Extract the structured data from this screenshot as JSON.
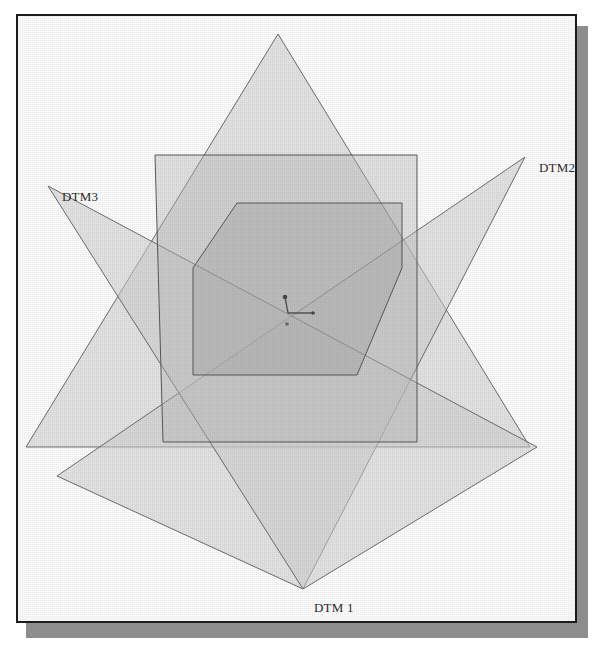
{
  "figure": {
    "background_color": "#ffffff",
    "frame_border_color": "#1c1c1c",
    "shadow_color": "#8d8d8d"
  },
  "labels": {
    "dtm1": "DTM 1",
    "dtm2": "DTM2",
    "dtm3": "DTM3"
  },
  "chart_data": {
    "type": "diagram",
    "subtype": "overlapping-polygon-extents",
    "xlabel": "",
    "ylabel": "",
    "grid": false,
    "legend_position": "inline-vertex-labels",
    "canvas": {
      "width": 557,
      "height": 605,
      "units": "px"
    },
    "fill_opacity_note": "semi-transparent grey fills; overlaps darken",
    "series": [
      {
        "name": "DTM 1",
        "shape": "triangle",
        "orientation": "apex-down",
        "fill": "#d2d2d2",
        "stroke": "#6e6e6e",
        "label_anchor": [
          303,
          589
        ],
        "vertices": [
          [
            278,
            34
          ],
          [
            530,
            447
          ],
          [
            26,
            447
          ]
        ],
        "note": "large triangle apex pointing down to bottom label"
      },
      {
        "name": "DTM2",
        "shape": "triangle",
        "orientation": "apex-down-left",
        "fill": "#d2d2d2",
        "stroke": "#6e6e6e",
        "label_anchor": [
          525,
          157
        ],
        "vertices": [
          [
            525,
            157
          ],
          [
            57,
            476
          ],
          [
            303,
            589
          ]
        ],
        "note": "top-right labelled vertex"
      },
      {
        "name": "DTM3",
        "shape": "triangle",
        "orientation": "apex-down-right",
        "fill": "#d2d2d2",
        "stroke": "#6e6e6e",
        "label_anchor": [
          48,
          186
        ],
        "vertices": [
          [
            48,
            186
          ],
          [
            537,
            447
          ],
          [
            303,
            589
          ]
        ],
        "note": "top-left labelled vertex"
      },
      {
        "name": "overlap-parallelogram",
        "shape": "parallelogram",
        "fill": "#bdbdbd",
        "stroke": "#5a5a5a",
        "vertices": [
          [
            155,
            155
          ],
          [
            417,
            155
          ],
          [
            417,
            442
          ],
          [
            163,
            442
          ]
        ],
        "note": "axis-aligned-ish quad outline over the star"
      },
      {
        "name": "core-hexagon",
        "shape": "hexagon",
        "fill": "#b0b0b0",
        "stroke": "#5a5a5a",
        "vertices": [
          [
            237,
            203
          ],
          [
            402,
            203
          ],
          [
            402,
            268
          ],
          [
            357,
            375
          ],
          [
            193,
            375
          ],
          [
            193,
            268
          ]
        ],
        "note": "darkest central region where all extents overlap"
      }
    ],
    "annotations": [
      {
        "name": "origin-axis-marker",
        "type": "axis-triad",
        "origin": [
          288,
          313
        ],
        "points": [
          {
            "name": "z-tip",
            "at": [
              285,
              297
            ]
          },
          {
            "name": "x-tip",
            "at": [
              313,
              313
            ]
          },
          {
            "name": "y-tip",
            "at": [
              287,
              324
            ]
          }
        ],
        "stroke": "#555555"
      }
    ]
  }
}
